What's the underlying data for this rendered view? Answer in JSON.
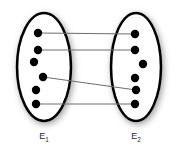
{
  "figure": {
    "type": "set-relation-diagram",
    "width": 174,
    "height": 152,
    "background_color": "#ffffff"
  },
  "style": {
    "ellipse_stroke_color": "#000000",
    "ellipse_fill_color": "#ffffff",
    "ellipse_stroke_width": 2.6,
    "shadow_color": "#9a9a9a",
    "dot_color": "#000000",
    "dot_radius": 4.2,
    "line_color": "#6e6e6e",
    "line_width": 1.0,
    "label_color": "#2b2b2b"
  },
  "sets": [
    {
      "id": "E1",
      "label_base": "E",
      "label_sub": "1",
      "label_x": 44,
      "label_y": 139,
      "ellipse": {
        "cx": 44,
        "cy": 67,
        "rx": 27,
        "ry": 54
      },
      "nodes": [
        {
          "id": "L1",
          "x": 38,
          "y": 33
        },
        {
          "id": "L2",
          "x": 38,
          "y": 50
        },
        {
          "id": "L3",
          "x": 34,
          "y": 62
        },
        {
          "id": "L4",
          "x": 43,
          "y": 77
        },
        {
          "id": "L5",
          "x": 36,
          "y": 90
        },
        {
          "id": "L6",
          "x": 36,
          "y": 104
        }
      ]
    },
    {
      "id": "E2",
      "label_base": "E",
      "label_sub": "2",
      "label_x": 136,
      "label_y": 139,
      "ellipse": {
        "cx": 136,
        "cy": 67,
        "rx": 25,
        "ry": 54
      },
      "nodes": [
        {
          "id": "R1",
          "x": 135,
          "y": 34
        },
        {
          "id": "R2",
          "x": 135,
          "y": 50
        },
        {
          "id": "R3",
          "x": 143,
          "y": 64
        },
        {
          "id": "R4",
          "x": 135,
          "y": 78
        },
        {
          "id": "R5",
          "x": 136,
          "y": 90
        },
        {
          "id": "R6",
          "x": 135,
          "y": 104
        }
      ]
    }
  ],
  "edges": [
    {
      "id": "edge-1",
      "from": "L1",
      "to": "R1",
      "x1": 38,
      "y1": 33,
      "x2": 135,
      "y2": 34
    },
    {
      "id": "edge-2",
      "from": "L2",
      "to": "R2",
      "x1": 38,
      "y1": 50,
      "x2": 135,
      "y2": 50
    },
    {
      "id": "edge-3",
      "from": "L4",
      "to": "R5",
      "x1": 43,
      "y1": 77,
      "x2": 136,
      "y2": 90
    },
    {
      "id": "edge-4",
      "from": "L6",
      "to": "R6",
      "x1": 36,
      "y1": 104,
      "x2": 135,
      "y2": 104
    }
  ]
}
